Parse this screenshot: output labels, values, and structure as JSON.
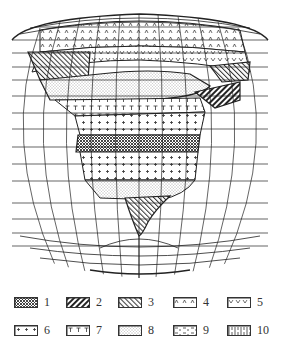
{
  "figure": {
    "type": "thematic map",
    "projection": "graticule globe (oblique, polar-centered)",
    "colors": {
      "ink": "#222222",
      "background": "#ffffff"
    }
  },
  "legend": {
    "items": [
      {
        "id": 1,
        "label": "1",
        "pattern": "cross-hatch-dense",
        "row": 0,
        "x": 14
      },
      {
        "id": 2,
        "label": "2",
        "pattern": "diagonal-thick-dark",
        "row": 0,
        "x": 66
      },
      {
        "id": 3,
        "label": "3",
        "pattern": "diagonal-light",
        "row": 0,
        "x": 118
      },
      {
        "id": 4,
        "label": "4",
        "pattern": "caret-small",
        "row": 0,
        "x": 173
      },
      {
        "id": 5,
        "label": "5",
        "pattern": "v-marks",
        "row": 0,
        "x": 227
      },
      {
        "id": 6,
        "label": "6",
        "pattern": "plus-signs",
        "row": 1,
        "x": 14
      },
      {
        "id": 7,
        "label": "7",
        "pattern": "t-marks",
        "row": 1,
        "x": 66
      },
      {
        "id": 8,
        "label": "8",
        "pattern": "dots-fine",
        "row": 1,
        "x": 118
      },
      {
        "id": 9,
        "label": "9",
        "pattern": "dashes",
        "row": 1,
        "x": 173
      },
      {
        "id": 10,
        "label": "10",
        "pattern": "vertical-bars",
        "row": 1,
        "x": 227
      }
    ]
  },
  "map_zones": [
    {
      "pattern": 4,
      "region": "upper cap band"
    },
    {
      "pattern": 5,
      "region": "upper band"
    },
    {
      "pattern": 3,
      "region": "left/right edge strips"
    },
    {
      "pattern": 8,
      "region": "central dotted belt"
    },
    {
      "pattern": 2,
      "region": "right dark hatch patch"
    },
    {
      "pattern": 7,
      "region": "T-mark band"
    },
    {
      "pattern": 6,
      "region": "plus band upper"
    },
    {
      "pattern": 1,
      "region": "cross-hatch central belt"
    },
    {
      "pattern": 6,
      "region": "plus band lower"
    },
    {
      "pattern": 9,
      "region": "lower dashed band"
    },
    {
      "pattern": 3,
      "region": "southern tail"
    }
  ]
}
